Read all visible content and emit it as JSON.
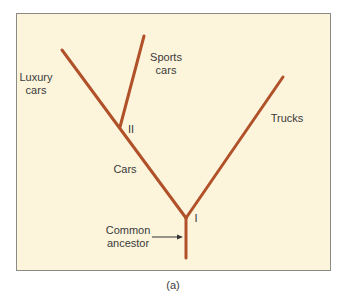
{
  "diagram": {
    "line_color": "#b0512a",
    "background": "#fcf5dc",
    "labels": {
      "luxury": [
        "Luxury",
        "cars"
      ],
      "sports": [
        "Sports",
        "cars"
      ],
      "trucks": "Trucks",
      "cars": "Cars",
      "common_ancestor": [
        "Common",
        "ancestor"
      ],
      "node_one": "I",
      "node_two": "II"
    },
    "caption": "(a)"
  }
}
